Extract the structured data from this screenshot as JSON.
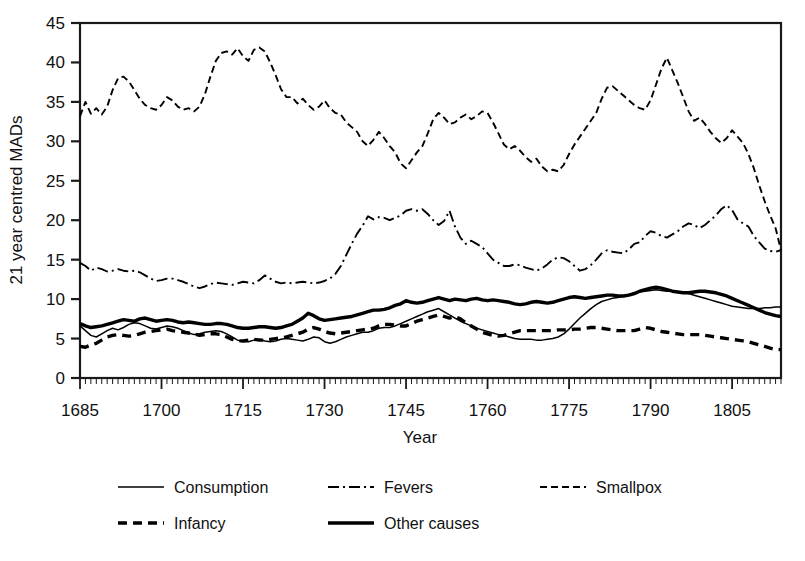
{
  "chart_data": {
    "type": "line",
    "title": "",
    "xlabel": "Year",
    "ylabel": "21 year centred MADs",
    "xlim": [
      1685,
      1814
    ],
    "ylim": [
      0,
      45
    ],
    "xticks": [
      1685,
      1700,
      1715,
      1730,
      1745,
      1760,
      1775,
      1790,
      1805
    ],
    "xticklabels": [
      "1685",
      "1700",
      "1715",
      "1730",
      "1745",
      "1760",
      "1775",
      "1790",
      "1805"
    ],
    "yticks": [
      0,
      5,
      10,
      15,
      20,
      25,
      30,
      35,
      40,
      45
    ],
    "yticklabels": [
      "0",
      "5",
      "10",
      "15",
      "20",
      "25",
      "30",
      "35",
      "40",
      "45"
    ],
    "minor_tick_step": 1,
    "grid": false,
    "legend_position": "below",
    "x": [
      1685,
      1686,
      1687,
      1688,
      1689,
      1690,
      1691,
      1692,
      1693,
      1694,
      1695,
      1696,
      1697,
      1698,
      1699,
      1700,
      1701,
      1702,
      1703,
      1704,
      1705,
      1706,
      1707,
      1708,
      1709,
      1710,
      1711,
      1712,
      1713,
      1714,
      1715,
      1716,
      1717,
      1718,
      1719,
      1720,
      1721,
      1722,
      1723,
      1724,
      1725,
      1726,
      1727,
      1728,
      1729,
      1730,
      1731,
      1732,
      1733,
      1734,
      1735,
      1736,
      1737,
      1738,
      1739,
      1740,
      1741,
      1742,
      1743,
      1744,
      1745,
      1746,
      1747,
      1748,
      1749,
      1750,
      1751,
      1752,
      1753,
      1754,
      1755,
      1756,
      1757,
      1758,
      1759,
      1760,
      1761,
      1762,
      1763,
      1764,
      1765,
      1766,
      1767,
      1768,
      1769,
      1770,
      1771,
      1772,
      1773,
      1774,
      1775,
      1776,
      1777,
      1778,
      1779,
      1780,
      1781,
      1782,
      1783,
      1784,
      1785,
      1786,
      1787,
      1788,
      1789,
      1790,
      1791,
      1792,
      1793,
      1794,
      1795,
      1796,
      1797,
      1798,
      1799,
      1800,
      1801,
      1802,
      1803,
      1804,
      1805,
      1806,
      1807,
      1808,
      1809,
      1810,
      1811,
      1812,
      1813,
      1814
    ],
    "series": [
      {
        "name": "Consumption",
        "style": "solid-thin",
        "values": [
          6.6,
          6.0,
          5.4,
          5.2,
          5.6,
          6.0,
          6.3,
          6.1,
          6.4,
          6.8,
          7.0,
          6.9,
          6.6,
          6.3,
          6.2,
          6.4,
          6.6,
          6.5,
          6.3,
          6.0,
          5.7,
          5.5,
          5.6,
          5.8,
          5.9,
          6.0,
          5.9,
          5.6,
          5.2,
          4.8,
          4.6,
          4.6,
          4.8,
          4.9,
          4.7,
          4.6,
          4.7,
          4.9,
          5.0,
          4.9,
          4.8,
          4.7,
          4.9,
          5.2,
          5.1,
          4.6,
          4.4,
          4.6,
          4.9,
          5.2,
          5.4,
          5.6,
          5.8,
          5.8,
          6.0,
          6.3,
          6.4,
          6.4,
          6.6,
          6.9,
          7.2,
          7.5,
          7.8,
          8.1,
          8.4,
          8.6,
          8.8,
          8.4,
          8.0,
          7.6,
          7.2,
          6.9,
          6.6,
          6.3,
          6.1,
          5.9,
          5.7,
          5.5,
          5.4,
          5.2,
          5.0,
          4.9,
          4.9,
          4.9,
          4.8,
          4.8,
          4.9,
          5.0,
          5.2,
          5.6,
          6.2,
          6.9,
          7.6,
          8.2,
          8.8,
          9.3,
          9.7,
          9.9,
          10.1,
          10.2,
          10.4,
          10.6,
          10.8,
          10.9,
          11.0,
          11.1,
          11.2,
          11.1,
          11.0,
          11.0,
          10.9,
          10.8,
          10.7,
          10.5,
          10.3,
          10.1,
          9.9,
          9.7,
          9.5,
          9.3,
          9.1,
          9.0,
          8.9,
          8.8,
          8.8,
          8.8,
          8.9,
          8.9,
          9.0,
          9.0
        ]
      },
      {
        "name": "Fevers",
        "style": "dashdot",
        "values": [
          14.6,
          14.2,
          13.6,
          14.0,
          13.8,
          13.5,
          13.6,
          13.8,
          13.6,
          13.5,
          13.6,
          13.4,
          13.0,
          12.6,
          12.3,
          12.4,
          12.6,
          12.6,
          12.4,
          12.2,
          11.9,
          11.6,
          11.4,
          11.6,
          11.9,
          12.1,
          12.0,
          11.9,
          11.8,
          12.0,
          12.2,
          12.1,
          12.0,
          12.4,
          13.0,
          12.6,
          12.2,
          12.0,
          12.1,
          12.0,
          12.1,
          12.2,
          12.1,
          12.0,
          12.1,
          12.3,
          12.6,
          13.2,
          14.2,
          15.6,
          17.0,
          18.3,
          19.3,
          20.5,
          20.1,
          20.4,
          20.3,
          20.0,
          20.3,
          20.6,
          21.2,
          21.4,
          21.2,
          21.4,
          20.8,
          20.0,
          19.4,
          19.9,
          21.2,
          19.2,
          17.8,
          17.0,
          17.4,
          17.0,
          16.6,
          15.8,
          15.0,
          14.6,
          14.2,
          14.2,
          14.4,
          14.3,
          14.0,
          13.8,
          13.6,
          13.9,
          14.4,
          15.0,
          15.3,
          15.2,
          14.8,
          14.2,
          13.6,
          13.8,
          14.3,
          15.0,
          15.8,
          16.2,
          16.0,
          15.9,
          15.8,
          16.3,
          17.0,
          17.2,
          18.0,
          18.6,
          18.4,
          18.0,
          17.8,
          18.2,
          18.6,
          19.2,
          19.6,
          19.4,
          19.0,
          19.4,
          20.0,
          20.6,
          21.4,
          21.9,
          21.3,
          20.1,
          19.6,
          19.2,
          18.0,
          17.2,
          16.4,
          16.1,
          16.0,
          16.2
        ]
      },
      {
        "name": "Smallpox",
        "style": "dashed-fine",
        "values": [
          33.2,
          35.0,
          33.5,
          34.2,
          33.4,
          34.4,
          36.5,
          38.0,
          38.2,
          37.6,
          36.5,
          35.4,
          34.6,
          34.2,
          34.0,
          34.6,
          35.6,
          35.2,
          34.4,
          34.0,
          34.2,
          33.8,
          34.4,
          36.0,
          38.2,
          40.2,
          41.2,
          41.4,
          41.0,
          41.8,
          40.8,
          40.2,
          41.6,
          41.9,
          41.4,
          40.0,
          38.4,
          36.6,
          35.6,
          35.6,
          34.8,
          35.4,
          34.6,
          34.0,
          34.4,
          35.2,
          34.2,
          33.6,
          33.4,
          32.4,
          31.8,
          31.2,
          30.0,
          29.4,
          30.2,
          31.2,
          30.4,
          29.4,
          28.6,
          27.2,
          26.6,
          27.6,
          28.6,
          29.4,
          31.0,
          32.8,
          33.6,
          33.0,
          32.2,
          32.4,
          33.0,
          33.4,
          32.8,
          33.2,
          33.8,
          33.6,
          32.4,
          31.0,
          29.6,
          29.0,
          29.4,
          28.8,
          28.0,
          27.4,
          27.8,
          26.8,
          26.2,
          26.4,
          26.2,
          27.0,
          28.4,
          29.6,
          30.6,
          31.6,
          32.6,
          33.6,
          35.4,
          36.8,
          37.0,
          36.4,
          35.8,
          35.2,
          34.6,
          34.2,
          34.0,
          35.2,
          37.2,
          39.2,
          40.6,
          39.0,
          37.4,
          35.6,
          33.8,
          32.6,
          33.0,
          32.2,
          31.2,
          30.4,
          29.8,
          30.4,
          31.4,
          30.6,
          29.8,
          28.4,
          26.6,
          24.4,
          22.4,
          20.6,
          19.0,
          16.2
        ]
      },
      {
        "name": "Infancy",
        "style": "dashed-thick",
        "values": [
          4.0,
          3.9,
          4.2,
          4.4,
          4.8,
          5.2,
          5.4,
          5.5,
          5.4,
          5.3,
          5.4,
          5.6,
          5.8,
          5.9,
          6.0,
          6.1,
          6.2,
          6.0,
          5.9,
          5.8,
          5.7,
          5.6,
          5.4,
          5.5,
          5.6,
          5.6,
          5.5,
          5.2,
          4.9,
          4.7,
          4.7,
          4.8,
          4.9,
          4.8,
          4.8,
          4.9,
          5.0,
          5.1,
          5.2,
          5.4,
          5.6,
          5.8,
          6.2,
          6.4,
          6.2,
          5.9,
          5.7,
          5.6,
          5.7,
          5.8,
          5.9,
          6.0,
          6.1,
          6.2,
          6.3,
          6.6,
          6.8,
          6.8,
          6.7,
          6.6,
          6.6,
          6.9,
          7.2,
          7.4,
          7.6,
          7.8,
          8.0,
          7.8,
          7.6,
          7.8,
          7.5,
          7.0,
          6.6,
          6.2,
          5.8,
          5.6,
          5.4,
          5.3,
          5.4,
          5.6,
          5.8,
          6.0,
          6.0,
          6.0,
          6.0,
          6.0,
          6.0,
          6.0,
          6.1,
          6.1,
          6.1,
          6.2,
          6.2,
          6.3,
          6.4,
          6.4,
          6.3,
          6.2,
          6.1,
          6.0,
          6.0,
          6.0,
          6.0,
          6.2,
          6.4,
          6.3,
          6.1,
          5.9,
          5.8,
          5.7,
          5.6,
          5.5,
          5.5,
          5.5,
          5.5,
          5.4,
          5.3,
          5.2,
          5.1,
          5.0,
          4.9,
          4.8,
          4.7,
          4.6,
          4.4,
          4.2,
          4.0,
          3.8,
          3.6,
          3.6
        ]
      },
      {
        "name": "Other causes",
        "style": "solid-thick",
        "values": [
          6.9,
          6.6,
          6.4,
          6.5,
          6.6,
          6.8,
          7.0,
          7.2,
          7.4,
          7.3,
          7.2,
          7.5,
          7.6,
          7.4,
          7.2,
          7.3,
          7.4,
          7.3,
          7.1,
          7.0,
          7.1,
          7.0,
          6.9,
          6.8,
          6.8,
          6.9,
          6.9,
          6.8,
          6.6,
          6.4,
          6.3,
          6.3,
          6.4,
          6.5,
          6.5,
          6.4,
          6.3,
          6.4,
          6.6,
          6.8,
          7.2,
          7.6,
          8.2,
          7.9,
          7.5,
          7.3,
          7.4,
          7.5,
          7.6,
          7.7,
          7.8,
          8.0,
          8.2,
          8.4,
          8.6,
          8.6,
          8.7,
          8.9,
          9.2,
          9.4,
          9.8,
          9.6,
          9.5,
          9.6,
          9.8,
          10.0,
          10.2,
          10.0,
          9.8,
          10.0,
          9.9,
          9.8,
          10.0,
          10.1,
          9.9,
          9.8,
          9.9,
          9.8,
          9.7,
          9.6,
          9.4,
          9.3,
          9.4,
          9.6,
          9.7,
          9.6,
          9.5,
          9.6,
          9.8,
          10.0,
          10.2,
          10.3,
          10.2,
          10.1,
          10.2,
          10.3,
          10.4,
          10.5,
          10.5,
          10.4,
          10.4,
          10.5,
          10.7,
          11.0,
          11.2,
          11.4,
          11.5,
          11.4,
          11.2,
          11.0,
          10.9,
          10.8,
          10.8,
          10.9,
          11.0,
          11.0,
          10.9,
          10.8,
          10.6,
          10.4,
          10.1,
          9.8,
          9.5,
          9.2,
          8.9,
          8.6,
          8.3,
          8.1,
          7.9,
          7.8
        ]
      }
    ],
    "legend": [
      {
        "label": "Consumption",
        "style": "solid-thin"
      },
      {
        "label": "Fevers",
        "style": "dashdot"
      },
      {
        "label": "Smallpox",
        "style": "dashed-fine"
      },
      {
        "label": "Infancy",
        "style": "dashed-thick"
      },
      {
        "label": "Other causes",
        "style": "solid-thick"
      }
    ]
  }
}
